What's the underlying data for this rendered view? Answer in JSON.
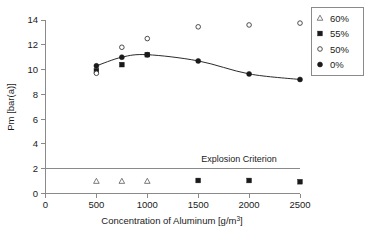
{
  "chart_data": {
    "type": "scatter",
    "title": "",
    "xlabel": "Concentration of Aluminum [g/m3]",
    "xlabel_main": "Concentration of Aluminum [g/m",
    "xlabel_sup": "3",
    "xlabel_tail": "]",
    "ylabel": "Pm [bar(a)]",
    "xlim": [
      0,
      2500
    ],
    "ylim": [
      0,
      14
    ],
    "xticks": [
      0,
      500,
      1000,
      1500,
      2000,
      2500
    ],
    "xtick_labels": [
      "0",
      "500",
      "1000",
      "1500",
      "2000",
      "2500"
    ],
    "yticks": [
      0,
      2,
      4,
      6,
      8,
      10,
      12,
      14
    ],
    "ytick_labels": [
      "0",
      "2",
      "4",
      "6",
      "8",
      "10",
      "12",
      "14"
    ],
    "grid": false,
    "legend_position": "outside-top-right",
    "annotations": [
      {
        "text": "Explosion Criterion",
        "x": 1900,
        "y": 2.55
      }
    ],
    "reference_lines": [
      {
        "name": "explosion-criterion",
        "y": 2.0,
        "x_from": 0,
        "x_to": 2500
      }
    ],
    "series": [
      {
        "name": "60%",
        "marker": "open-triangle",
        "points": [
          {
            "x": 500,
            "y": 1.0
          },
          {
            "x": 750,
            "y": 1.0
          },
          {
            "x": 1000,
            "y": 1.0
          }
        ]
      },
      {
        "name": "55%",
        "marker": "filled-square",
        "points": [
          {
            "x": 500,
            "y": 9.9
          },
          {
            "x": 750,
            "y": 10.4
          },
          {
            "x": 1000,
            "y": 11.2
          },
          {
            "x": 1500,
            "y": 1.05
          },
          {
            "x": 2000,
            "y": 1.05
          },
          {
            "x": 2500,
            "y": 0.95
          }
        ]
      },
      {
        "name": "50%",
        "marker": "open-circle",
        "points": [
          {
            "x": 500,
            "y": 9.7
          },
          {
            "x": 750,
            "y": 11.8
          },
          {
            "x": 1000,
            "y": 12.5
          },
          {
            "x": 1500,
            "y": 13.45
          },
          {
            "x": 2000,
            "y": 13.6
          },
          {
            "x": 2500,
            "y": 13.75
          }
        ]
      },
      {
        "name": "0%",
        "marker": "filled-circle",
        "points": [
          {
            "x": 500,
            "y": 10.3
          },
          {
            "x": 750,
            "y": 11.0
          },
          {
            "x": 1000,
            "y": 11.2
          },
          {
            "x": 1500,
            "y": 10.7
          },
          {
            "x": 2000,
            "y": 9.65
          },
          {
            "x": 2500,
            "y": 9.2
          }
        ],
        "has_trend_line": true
      }
    ]
  },
  "legend": {
    "items": [
      {
        "label": "60%",
        "marker": "open-triangle"
      },
      {
        "label": "55%",
        "marker": "filled-square"
      },
      {
        "label": "50%",
        "marker": "open-circle"
      },
      {
        "label": "0%",
        "marker": "filled-circle"
      }
    ]
  },
  "colors": {
    "axis": "#8a8a8a",
    "marker": "#1a1a1a",
    "line": "#2b2b2b",
    "background": "#ffffff"
  }
}
